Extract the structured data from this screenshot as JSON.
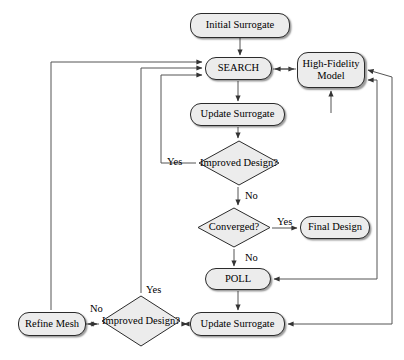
{
  "diagram": {
    "type": "flowchart",
    "canvas": {
      "width": 404,
      "height": 360
    },
    "style": {
      "node_fill": "#ececec",
      "node_stroke": "#2b2b2b",
      "edge_stroke": "#555555",
      "text_color": "#000000",
      "background": "#ffffff"
    },
    "nodes": [
      {
        "id": "initial-surrogate",
        "label": "Initial Surrogate",
        "shape": "rounded-rect",
        "x": 190,
        "y": 13,
        "w": 100,
        "h": 25
      },
      {
        "id": "search",
        "label": "SEARCH",
        "shape": "rounded-rect",
        "x": 205,
        "y": 57,
        "w": 67,
        "h": 23
      },
      {
        "id": "high-fidelity-model",
        "label": "High-Fidelity Model",
        "label_line1": "High-Fidelity",
        "label_line2": "Model",
        "shape": "rounded-rect",
        "x": 297,
        "y": 52,
        "w": 68,
        "h": 36
      },
      {
        "id": "update-surrogate-top",
        "label": "Update Surrogate",
        "shape": "rounded-rect",
        "x": 190,
        "y": 103,
        "w": 95,
        "h": 23
      },
      {
        "id": "improved-design-top",
        "label": "Improved Design?",
        "label_line1": "Improved",
        "label_line2": "Design?",
        "shape": "diamond",
        "x": 198,
        "y": 140,
        "w": 82,
        "h": 46
      },
      {
        "id": "converged",
        "label": "Converged?",
        "shape": "diamond",
        "x": 197,
        "y": 207,
        "w": 74,
        "h": 41
      },
      {
        "id": "final-design",
        "label": "Final Design",
        "shape": "rounded-rect",
        "x": 300,
        "y": 216,
        "w": 70,
        "h": 23
      },
      {
        "id": "poll",
        "label": "POLL",
        "shape": "rounded-rect",
        "x": 205,
        "y": 268,
        "w": 66,
        "h": 22
      },
      {
        "id": "improved-design-bottom",
        "label": "Improved Design?",
        "label_line1": "Improved",
        "label_line2": "Design?",
        "shape": "diamond",
        "x": 101,
        "y": 295,
        "w": 80,
        "h": 52
      },
      {
        "id": "update-surrogate-bottom",
        "label": "Update Surrogate",
        "shape": "rounded-rect",
        "x": 190,
        "y": 312,
        "w": 95,
        "h": 24
      },
      {
        "id": "refine-mesh",
        "label": "Refine Mesh",
        "shape": "rounded-rect",
        "x": 18,
        "y": 312,
        "w": 68,
        "h": 24
      }
    ],
    "edge_labels": [
      {
        "id": "yes-improved-top",
        "text": "Yes",
        "x": 167,
        "y": 156
      },
      {
        "id": "no-improved-top",
        "text": "No",
        "x": 245,
        "y": 190
      },
      {
        "id": "yes-converged",
        "text": "Yes",
        "x": 277,
        "y": 216
      },
      {
        "id": "no-converged",
        "text": "No",
        "x": 245,
        "y": 252
      },
      {
        "id": "yes-improved-bottom",
        "text": "Yes",
        "x": 146,
        "y": 284
      },
      {
        "id": "no-improved-bottom",
        "text": "No",
        "x": 90,
        "y": 303
      }
    ]
  }
}
